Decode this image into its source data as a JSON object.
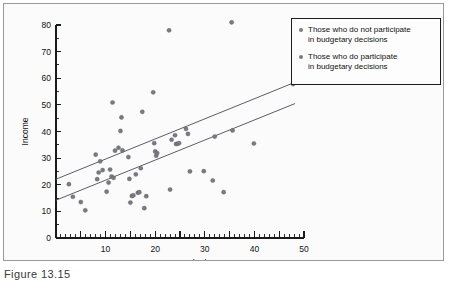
{
  "figure": {
    "caption": "Figure 13.15"
  },
  "legend": {
    "position": "top-right",
    "marker_color": "#7a7a84",
    "entries": [
      {
        "label": "Those who do not participate\nin budgetary decisions"
      },
      {
        "label": "Those who do participate\nin budgetary decisions"
      }
    ]
  },
  "chart_data": {
    "type": "scatter",
    "title": "",
    "subtitle": "",
    "xlabel": "Years Worked",
    "ylabel": "Income",
    "xlim": [
      0,
      50
    ],
    "ylim": [
      0,
      80
    ],
    "xticks": [
      0,
      10,
      20,
      30,
      40,
      50
    ],
    "yticks": [
      0,
      10,
      20,
      30,
      40,
      50,
      60,
      70,
      80
    ],
    "xtick_labels": [
      "0",
      "10",
      "20",
      "30",
      "40",
      "50"
    ],
    "ytick_labels": [
      "0",
      "10",
      "20",
      "30",
      "40",
      "50",
      "60",
      "70",
      "80"
    ],
    "x_minor_tick_interval": 1,
    "y_minor_tick_interval": 5,
    "grid": false,
    "point_color": "#7a7a84",
    "line_color": "#5d5d66",
    "series": [
      {
        "name": "Those who do not participate in budgetary decisions",
        "points": [
          [
            2.6,
            20.2
          ],
          [
            3.4,
            15.5
          ],
          [
            5.0,
            13.5
          ],
          [
            5.9,
            10.4
          ],
          [
            8.0,
            31.3
          ],
          [
            8.3,
            22.1
          ],
          [
            8.6,
            24.6
          ],
          [
            8.9,
            28.8
          ],
          [
            9.4,
            25.5
          ],
          [
            10.2,
            17.4
          ],
          [
            10.6,
            20.8
          ],
          [
            10.9,
            25.7
          ],
          [
            11.2,
            23.1
          ],
          [
            11.4,
            50.9
          ],
          [
            11.6,
            22.6
          ],
          [
            11.9,
            32.8
          ],
          [
            12.6,
            33.9
          ],
          [
            13.0,
            40.2
          ],
          [
            13.2,
            45.3
          ],
          [
            13.4,
            32.9
          ],
          [
            14.6,
            30.4
          ],
          [
            14.8,
            22.2
          ],
          [
            15.0,
            13.3
          ],
          [
            15.3,
            15.8
          ],
          [
            15.6,
            16.0
          ],
          [
            16.1,
            23.9
          ],
          [
            16.5,
            17.0
          ],
          [
            16.8,
            17.2
          ],
          [
            17.1,
            26.2
          ],
          [
            17.4,
            47.4
          ],
          [
            17.8,
            11.2
          ],
          [
            18.2,
            15.7
          ],
          [
            19.6,
            54.7
          ],
          [
            19.8,
            35.6
          ],
          [
            20.0,
            32.5
          ],
          [
            20.2,
            30.9
          ],
          [
            20.4,
            31.9
          ],
          [
            22.8,
            78.0
          ],
          [
            23.0,
            18.2
          ],
          [
            23.3,
            36.9
          ],
          [
            24.0,
            38.6
          ],
          [
            24.2,
            35.3
          ],
          [
            24.5,
            35.4
          ],
          [
            24.8,
            35.6
          ],
          [
            26.2,
            41.0
          ],
          [
            26.6,
            39.1
          ],
          [
            27.0,
            25.0
          ],
          [
            29.8,
            25.1
          ],
          [
            31.6,
            21.6
          ],
          [
            32.0,
            38.1
          ],
          [
            33.8,
            17.2
          ],
          [
            35.4,
            81.0
          ],
          [
            35.6,
            40.4
          ],
          [
            39.9,
            35.5
          ],
          [
            47.8,
            57.8
          ]
        ]
      }
    ],
    "trend_lines": [
      {
        "name": "upper-fit-line",
        "x_start": 0.0,
        "y_start": 22.1,
        "x_end": 48.2,
        "y_end": 58.5
      },
      {
        "name": "lower-fit-line",
        "x_start": 0.0,
        "y_start": 14.2,
        "x_end": 48.2,
        "y_end": 50.5
      }
    ]
  }
}
